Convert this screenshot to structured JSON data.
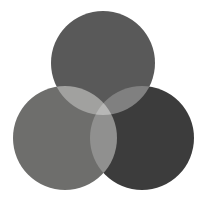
{
  "figure": {
    "name": "three-circle-venn-diagram",
    "width": 207,
    "height": 204,
    "background_color": "#ffffff",
    "blend_mode": "screen",
    "title": ""
  },
  "chart_data": {
    "type": "venn",
    "title": "",
    "subtitle": "",
    "xlabel": "",
    "ylabel": "",
    "legend_position": "none",
    "grid": false,
    "set_count": 3,
    "sets": [
      {
        "id": "top",
        "label": "",
        "center_x": 103,
        "center_y": 63,
        "radius": 52,
        "fill_color": "#595959",
        "opacity": 1
      },
      {
        "id": "bottom-left",
        "label": "",
        "center_x": 65,
        "center_y": 138,
        "radius": 52,
        "fill_color": "#6e6e6c",
        "opacity": 1
      },
      {
        "id": "bottom-right",
        "label": "",
        "center_x": 142,
        "center_y": 138,
        "radius": 52,
        "fill_color": "#3c3c3c",
        "opacity": 1
      }
    ],
    "regions": [
      {
        "id": "top-only",
        "sets": [
          "top"
        ],
        "label": "",
        "color": "#595959"
      },
      {
        "id": "bottom-left-only",
        "sets": [
          "bottom-left"
        ],
        "label": "",
        "color": "#6e6e6c"
      },
      {
        "id": "bottom-right-only",
        "sets": [
          "bottom-right"
        ],
        "label": "",
        "color": "#3c3c3c"
      },
      {
        "id": "top-and-bottom-left",
        "sets": [
          "top",
          "bottom-left"
        ],
        "label": "",
        "color": "#e8e8e6"
      },
      {
        "id": "top-and-bottom-right",
        "sets": [
          "top",
          "bottom-right"
        ],
        "label": "",
        "color": "#b4b4b2"
      },
      {
        "id": "bottom-left-and-bottom-right",
        "sets": [
          "bottom-left",
          "bottom-right"
        ],
        "label": "",
        "color": "#a9a9a7"
      },
      {
        "id": "all-three",
        "sets": [
          "top",
          "bottom-left",
          "bottom-right"
        ],
        "label": "",
        "color": "#fbfbf9"
      }
    ]
  }
}
